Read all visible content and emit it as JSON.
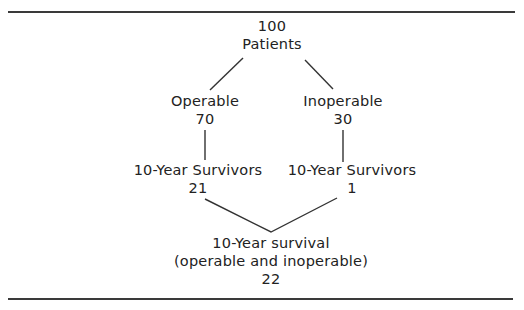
{
  "diagram": {
    "type": "flow-tree",
    "root": {
      "count": "100",
      "label": "Patients"
    },
    "branches": [
      {
        "label": "Operable",
        "count": "70",
        "survivors_label": "10-Year Survivors",
        "survivors_count": "21"
      },
      {
        "label": "Inoperable",
        "count": "30",
        "survivors_label": "10-Year Survivors",
        "survivors_count": "1"
      }
    ],
    "total": {
      "label": "10-Year survival",
      "sublabel": "(operable and inoperable)",
      "count": "22"
    }
  }
}
